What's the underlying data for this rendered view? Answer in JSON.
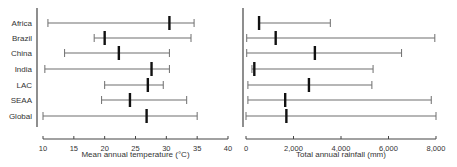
{
  "chart_data": [
    {
      "type": "range-median",
      "title": "",
      "xlabel": "Mean annual temperature (°C)",
      "ylabel": "",
      "xlim": [
        10,
        40
      ],
      "xticks": [
        10,
        15,
        20,
        25,
        30,
        35,
        40
      ],
      "xtick_labels": [
        "10",
        "15",
        "20",
        "25",
        "30",
        "35",
        "40"
      ],
      "categories": [
        "Africa",
        "Brazil",
        "China",
        "India",
        "LAC",
        "SEAA",
        "Global"
      ],
      "min": [
        10.8,
        18.3,
        13.5,
        10.3,
        20.0,
        19.5,
        10.0
      ],
      "median": [
        30.5,
        20.0,
        22.3,
        27.6,
        27.0,
        24.1,
        26.8
      ],
      "max": [
        34.5,
        34.0,
        30.5,
        30.5,
        29.5,
        33.3,
        35.0
      ],
      "grid": false,
      "legend": null
    },
    {
      "type": "range-median",
      "title": "",
      "xlabel": "Total annual rainfall (mm)",
      "ylabel": "",
      "xlim": [
        0,
        8000
      ],
      "xticks": [
        0,
        2000,
        4000,
        6000,
        8000
      ],
      "xtick_labels": [
        "0",
        "2,000",
        "4,000",
        "6,000",
        "8,000"
      ],
      "categories": [
        "Africa",
        "Brazil",
        "China",
        "India",
        "LAC",
        "SEAA",
        "Global"
      ],
      "min": [
        550,
        30,
        30,
        250,
        80,
        80,
        0
      ],
      "median": [
        550,
        1250,
        2900,
        350,
        2650,
        1650,
        1700
      ],
      "max": [
        3550,
        7950,
        6550,
        5350,
        5300,
        7800,
        8000
      ],
      "grid": false,
      "legend": null
    }
  ],
  "colors": {
    "range_line": "#6e6e6e",
    "median_marker": "#111111",
    "axis": "#444444"
  }
}
